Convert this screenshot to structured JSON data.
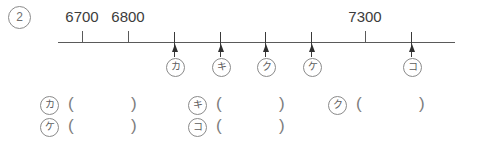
{
  "problem": {
    "number_label": "2"
  },
  "number_line": {
    "start_x": 58,
    "end_x": 455,
    "y": 42,
    "scale_ticks": [
      {
        "value_label": "6700",
        "x": 82,
        "labeled": true
      },
      {
        "value_label": "6800",
        "x": 128,
        "labeled": true
      },
      {
        "value_label": "7300",
        "x": 365,
        "labeled": true
      }
    ],
    "markers": [
      {
        "kana": "カ",
        "x": 175
      },
      {
        "kana": "キ",
        "x": 221
      },
      {
        "kana": "ク",
        "x": 266
      },
      {
        "kana": "ケ",
        "x": 312
      },
      {
        "kana": "コ",
        "x": 412
      }
    ]
  },
  "answer_rows": [
    {
      "y": 96,
      "slots": [
        {
          "kana": "カ",
          "x": 40,
          "open": "(",
          "close": ")",
          "value": ""
        },
        {
          "kana": "キ",
          "x": 188,
          "open": "(",
          "close": ")",
          "value": ""
        },
        {
          "kana": "ク",
          "x": 328,
          "open": "(",
          "close": ")",
          "value": ""
        }
      ]
    },
    {
      "y": 118,
      "slots": [
        {
          "kana": "ケ",
          "x": 40,
          "open": "(",
          "close": ")",
          "value": ""
        },
        {
          "kana": "コ",
          "x": 188,
          "open": "(",
          "close": ")",
          "value": ""
        }
      ]
    }
  ],
  "colors": {
    "line": "#5a5a5a",
    "arrow": "#2f2f2f",
    "text": "#3c3c3c",
    "circle_outline": "#8a8a8a",
    "background": "#ffffff"
  }
}
